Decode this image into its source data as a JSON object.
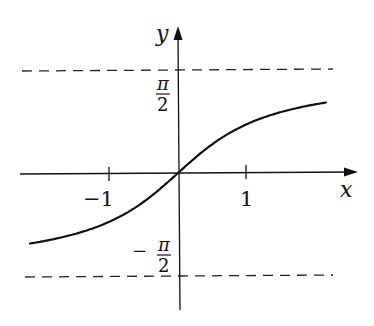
{
  "chart_data": {
    "type": "line",
    "title": "",
    "function": "y = arctan(x)",
    "xlabel": "x",
    "ylabel": "y",
    "x_ticks": [
      {
        "value": -1,
        "label": "−1"
      },
      {
        "value": 1,
        "label": "1"
      }
    ],
    "y_ticks": [
      {
        "value": 1.5708,
        "label_num": "π",
        "label_den": "2",
        "label_sign": ""
      },
      {
        "value": -1.5708,
        "label_num": "π",
        "label_den": "2",
        "label_sign": "−"
      }
    ],
    "asymptotes": [
      {
        "y": 1.5708,
        "style": "dashed"
      },
      {
        "y": -1.5708,
        "style": "dashed"
      }
    ],
    "x": [
      -2.2,
      -2.0,
      -1.5,
      -1.0,
      -0.5,
      0,
      0.5,
      1.0,
      1.5,
      2.0,
      2.2
    ],
    "values": [
      -1.144,
      -1.107,
      -0.983,
      -0.785,
      -0.464,
      0,
      0.464,
      0.785,
      0.983,
      1.107,
      1.144
    ],
    "xlim": [
      -2.3,
      2.7
    ],
    "ylim": [
      -2.0,
      2.3
    ],
    "grid": false,
    "legend": null,
    "colors": {
      "curve": "#111111",
      "axes": "#111111",
      "dashed": "#222222"
    }
  },
  "labels": {
    "x_axis": "x",
    "y_axis": "y",
    "tick_neg1": "−1",
    "tick_pos1": "1",
    "pi": "π",
    "two": "2",
    "minus": "−"
  }
}
